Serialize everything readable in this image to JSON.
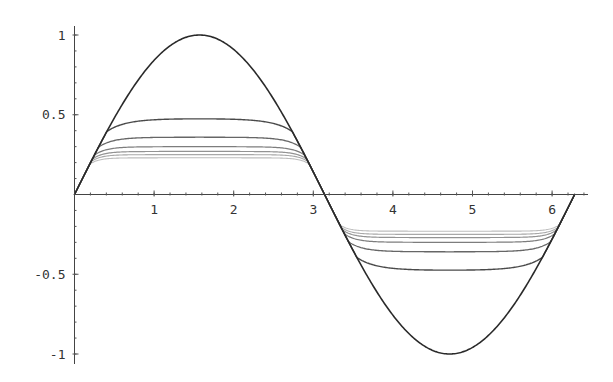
{
  "chart_data": {
    "type": "line",
    "title": "",
    "xlabel": "",
    "ylabel": "",
    "xlim": [
      0,
      6.4
    ],
    "ylim": [
      -1.05,
      1.05
    ],
    "grid": false,
    "legend": null,
    "x_ticks": [
      {
        "value": 1,
        "label": "1"
      },
      {
        "value": 2,
        "label": "2"
      },
      {
        "value": 3,
        "label": "3"
      },
      {
        "value": 4,
        "label": "4"
      },
      {
        "value": 5,
        "label": "5"
      },
      {
        "value": 6,
        "label": "6"
      }
    ],
    "y_ticks": [
      {
        "value": 1,
        "label": "1"
      },
      {
        "value": 0.5,
        "label": "0.5"
      },
      {
        "value": -0.5,
        "label": "-0.5"
      },
      {
        "value": -1,
        "label": "-1"
      }
    ],
    "x_minor_step": 0.2,
    "y_minor_step": 0.1,
    "domain_x": [
      0,
      6.2832
    ],
    "series": [
      {
        "name": "sin(x)",
        "amplitude": 1.0,
        "color": "#2a2a2a",
        "width": 1.6
      },
      {
        "name": "curve 2",
        "amplitude": 0.48,
        "color": "#4a4a4a",
        "width": 1.4
      },
      {
        "name": "curve 3",
        "amplitude": 0.36,
        "color": "#666666",
        "width": 1.3
      },
      {
        "name": "curve 4",
        "amplitude": 0.3,
        "color": "#7d7d7d",
        "width": 1.2
      },
      {
        "name": "curve 5",
        "amplitude": 0.27,
        "color": "#939393",
        "width": 1.2
      },
      {
        "name": "curve 6",
        "amplitude": 0.25,
        "color": "#a8a8a8",
        "width": 1.1
      },
      {
        "name": "curve 7",
        "amplitude": 0.23,
        "color": "#bdbdbd",
        "width": 1.1
      }
    ],
    "sample_values": {
      "x": [
        0,
        0.5,
        1.0,
        1.5708,
        2.0,
        2.5,
        3.1416,
        3.5,
        4.0,
        4.7124,
        5.0,
        5.5,
        6.2832
      ],
      "sin(x)": [
        0,
        0.479,
        0.841,
        1.0,
        0.909,
        0.598,
        0,
        -0.351,
        -0.757,
        -1.0,
        -0.959,
        -0.706,
        0
      ],
      "curve 2 plateau": 0.48,
      "curve 3 plateau": 0.36,
      "curve 4 plateau": 0.3,
      "curve 5 plateau": 0.27,
      "curve 6 plateau": 0.25,
      "curve 7 plateau": 0.23
    }
  },
  "layout": {
    "origin_px": [
      74.5,
      194.5
    ],
    "px_per_x": 79.6,
    "px_per_y": 159.5,
    "x_axis_end_px": 588,
    "y_axis_top_px": 26,
    "y_axis_bottom_px": 364
  }
}
